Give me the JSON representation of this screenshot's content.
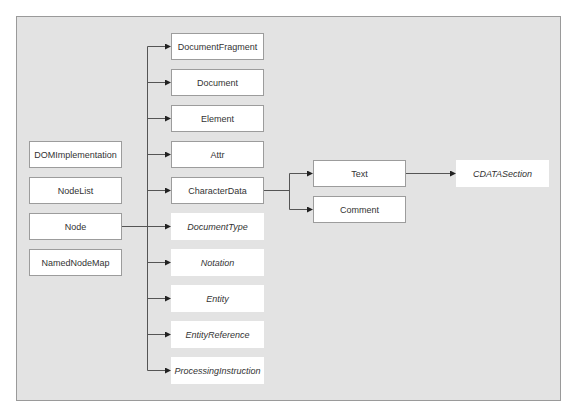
{
  "diagram": {
    "left_column": [
      {
        "id": "domimplementation",
        "label": "DOMImplementation",
        "italic": false
      },
      {
        "id": "nodelist",
        "label": "NodeList",
        "italic": false
      },
      {
        "id": "node",
        "label": "Node",
        "italic": false
      },
      {
        "id": "namednodemap",
        "label": "NamedNodeMap",
        "italic": false
      }
    ],
    "node_children": [
      {
        "id": "documentfragment",
        "label": "DocumentFragment",
        "italic": false
      },
      {
        "id": "document",
        "label": "Document",
        "italic": false
      },
      {
        "id": "element",
        "label": "Element",
        "italic": false
      },
      {
        "id": "attr",
        "label": "Attr",
        "italic": false
      },
      {
        "id": "characterdata",
        "label": "CharacterData",
        "italic": false
      },
      {
        "id": "documenttype",
        "label": "DocumentType",
        "italic": true
      },
      {
        "id": "notation",
        "label": "Notation",
        "italic": true
      },
      {
        "id": "entity",
        "label": "Entity",
        "italic": true
      },
      {
        "id": "entityreference",
        "label": "EntityReference",
        "italic": true
      },
      {
        "id": "processinginstruction",
        "label": "ProcessingInstruction",
        "italic": true
      }
    ],
    "characterdata_children": [
      {
        "id": "text",
        "label": "Text",
        "italic": false
      },
      {
        "id": "comment",
        "label": "Comment",
        "italic": false
      }
    ],
    "text_children": [
      {
        "id": "cdatasection",
        "label": "CDATASection",
        "italic": true
      }
    ],
    "edges": [
      [
        "Node",
        "DocumentFragment"
      ],
      [
        "Node",
        "Document"
      ],
      [
        "Node",
        "Element"
      ],
      [
        "Node",
        "Attr"
      ],
      [
        "Node",
        "CharacterData"
      ],
      [
        "Node",
        "DocumentType"
      ],
      [
        "Node",
        "Notation"
      ],
      [
        "Node",
        "Entity"
      ],
      [
        "Node",
        "EntityReference"
      ],
      [
        "Node",
        "ProcessingInstruction"
      ],
      [
        "CharacterData",
        "Text"
      ],
      [
        "CharacterData",
        "Comment"
      ],
      [
        "Text",
        "CDATASection"
      ]
    ],
    "colors": {
      "frame_background": "#e3e3e3",
      "box_background": "#ffffff",
      "box_border": "#9c9c9c",
      "line": "#555555"
    }
  }
}
